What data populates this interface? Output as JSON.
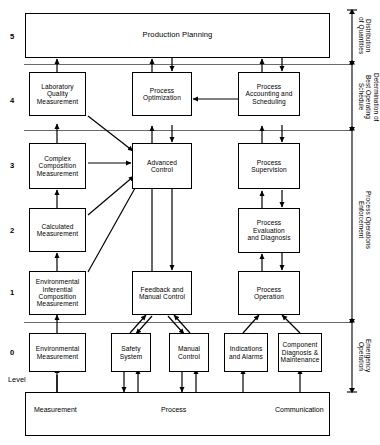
{
  "diagram": {
    "level_axis_caption": "Level",
    "levels": [
      {
        "number": "5"
      },
      {
        "number": "4"
      },
      {
        "number": "3"
      },
      {
        "number": "2"
      },
      {
        "number": "1"
      },
      {
        "number": "0"
      }
    ],
    "boxes": {
      "production_planning": "Production Planning",
      "laboratory_quality_measurement": "Laboratory\nQuality\nMeasurement",
      "process_optimization": "Process\nOptimization",
      "process_accounting_and_scheduling": "Process\nAccounting and\nScheduling",
      "complex_composition_measurement": "Complex\nComposition\nMeasurement",
      "advanced_control": "Advanced\nControl",
      "process_supervision": "Process\nSupervision",
      "calculated_measurement": "Calculated\nMeasurement",
      "process_evaluation_and_diagnosis": "Process\nEvaluation\nand Diagnosis",
      "environmental_inferential_composition_measurement": "Environmental\nInferential\nComposition\nMeasurement",
      "feedback_and_manual_control": "Feedback and\nManual Control",
      "process_operation": "Process\nOperation",
      "environmental_measurement": "Environmental\nMeasurement",
      "safety_system": "Safety\nSystem",
      "manual_control": "Manual\nControl",
      "indications_and_alarms": "Indications\nand Alarms",
      "component_diagnosis_and_maintenance": "Component\nDiagnosis &\nMaintenance"
    },
    "bottom_bar": {
      "measurement": "Measurement",
      "process": "Process",
      "communication": "Communication"
    },
    "right_brackets": [
      {
        "label": "Distribution\nof Quantities"
      },
      {
        "label": "Determination of\nBest Operating\nSchedule"
      },
      {
        "label": "Process Operations\nEnforcement"
      },
      {
        "label": "Emergency\nOperation"
      }
    ],
    "colors": {
      "stroke": "#000000",
      "background": "#ffffff",
      "separator": "#555555"
    }
  }
}
